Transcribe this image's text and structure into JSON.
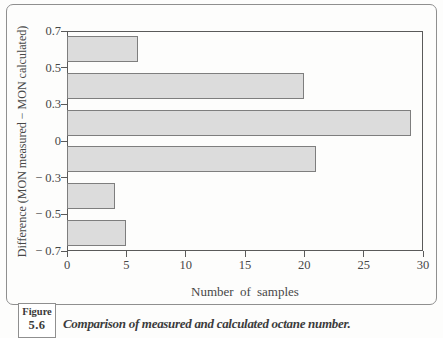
{
  "colors": {
    "background": "#fdfdfc",
    "text": "#474747",
    "axis": "#5a5a5a",
    "frame_border": "#8f8f8f",
    "bar_fill": "#dcdcdc",
    "bar_border": "#7e7e7e"
  },
  "figure": {
    "label": "Figure",
    "number": "5.6",
    "caption": "Comparison of measured and calculated octane number."
  },
  "chart_data": {
    "type": "bar",
    "orientation": "horizontal",
    "title": "",
    "xlabel": "Number of samples",
    "ylabel": "Difference (MON measured − MON calculated)",
    "xlim": [
      0,
      30
    ],
    "x_ticks": [
      0,
      5,
      10,
      15,
      20,
      25,
      30
    ],
    "x_tick_labels": [
      "0",
      "5",
      "10",
      "15",
      "20",
      "25",
      "30"
    ],
    "y_boundary_labels": [
      "0.7",
      "0.5",
      "0.3",
      "0",
      "− 0.3",
      "− 0.5",
      "− 0.7"
    ],
    "categories": [
      "0.5 to 0.7",
      "0.3 to 0.5",
      "0 to 0.3",
      "-0.3 to 0",
      "-0.5 to -0.3",
      "-0.7 to -0.5"
    ],
    "values": [
      6,
      20,
      29,
      21,
      4,
      5
    ],
    "grid": false,
    "legend": "none"
  }
}
